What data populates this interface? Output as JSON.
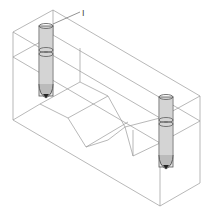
{
  "figure": {
    "label": "I",
    "colors": {
      "edge": "#9a9a9a",
      "probe": "#555555",
      "background": "#ffffff"
    }
  },
  "geometry": {
    "box": {
      "top_back_left": [
        53,
        10
      ],
      "top_front_left": [
        13,
        32
      ],
      "top_back_right": [
        200,
        96
      ],
      "top_front_right": [
        160,
        118
      ],
      "bottom_front_left": [
        13,
        120
      ],
      "bottom_front_right": [
        160,
        206
      ],
      "bottom_back_right": [
        200,
        183
      ]
    },
    "probes": [
      {
        "name": "probe-left",
        "cx": 46,
        "top": 26,
        "bottom": 97,
        "r": 7
      },
      {
        "name": "probe-right",
        "cx": 166,
        "top": 97,
        "bottom": 168,
        "r": 7
      }
    ],
    "leader": {
      "from": [
        54,
        24
      ],
      "to": [
        80,
        12
      ],
      "label_pos": [
        83,
        14
      ]
    }
  }
}
